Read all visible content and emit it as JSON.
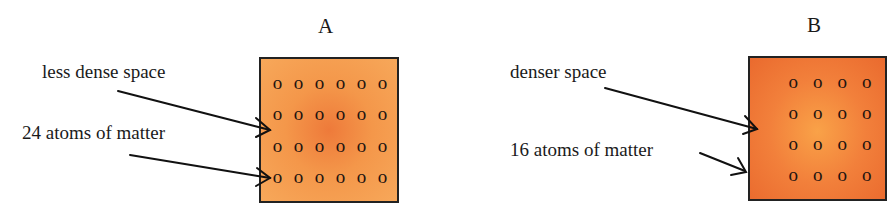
{
  "panels": [
    {
      "title": "A",
      "labels": {
        "space": "less dense space",
        "atoms": "24 atoms of matter"
      },
      "atom_glyph": "o",
      "atom_rows": 4,
      "atom_cols": 6,
      "atom_count": 24,
      "colors": {
        "center": "#ee7a3a",
        "edge": "#f7a85a"
      }
    },
    {
      "title": "B",
      "labels": {
        "space": "denser space",
        "atoms": "16 atoms of  matter"
      },
      "atom_glyph": "o",
      "atom_rows": 4,
      "atom_cols": 4,
      "atom_count": 16,
      "colors": {
        "center": "#f9a248",
        "edge": "#ea6a2e"
      }
    }
  ]
}
